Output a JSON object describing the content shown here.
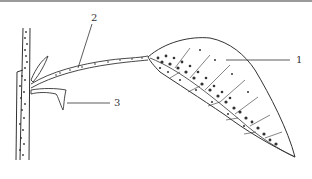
{
  "figure": {
    "type": "botanical-diagram",
    "labels": [
      {
        "id": "1",
        "text": "1",
        "part": "leaf blade"
      },
      {
        "id": "2",
        "text": "2",
        "part": "petiole"
      },
      {
        "id": "3",
        "text": "3",
        "part": "stipule"
      }
    ],
    "colors": {
      "line": "#333333",
      "background": "#ffffff",
      "top_rule": "#9a9a9a"
    }
  }
}
